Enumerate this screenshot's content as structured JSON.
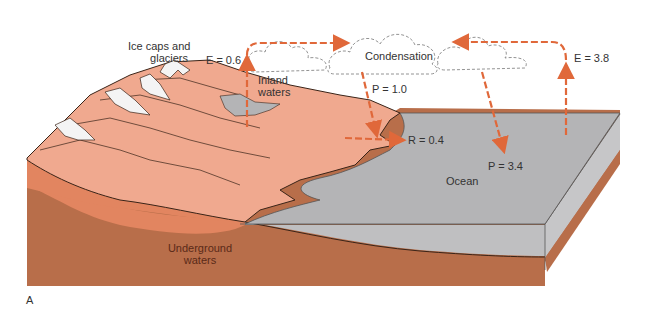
{
  "figure": {
    "panel_label": "A"
  },
  "labels": {
    "ice_caps": "Ice caps and\nglaciers",
    "ice_caps_line1": "Ice caps and",
    "ice_caps_line2": "glaciers",
    "inland_line1": "Inland",
    "inland_line2": "waters",
    "condensation": "Condensation",
    "ocean": "Ocean",
    "underground_line1": "Underground",
    "underground_line2": "waters"
  },
  "flows": [
    {
      "id": "evap_land",
      "label": "E = 0.6",
      "type": "evaporation",
      "from": "inland waters",
      "to": "atmosphere"
    },
    {
      "id": "precip_land",
      "label": "P = 1.0",
      "type": "precipitation",
      "from": "clouds",
      "to": "land"
    },
    {
      "id": "runoff",
      "label": "R = 0.4",
      "type": "runoff",
      "from": "land",
      "to": "ocean"
    },
    {
      "id": "precip_ocean",
      "label": "P = 3.4",
      "type": "precipitation",
      "from": "clouds",
      "to": "ocean"
    },
    {
      "id": "evap_ocean",
      "label": "E = 3.8",
      "type": "evaporation",
      "from": "ocean",
      "to": "atmosphere"
    }
  ],
  "colors": {
    "arrow": "#e0683a",
    "land_surface": "#f0a98f",
    "land_mid_layer": "#e28560",
    "bedrock": "#b86e4a",
    "ocean_top": "#b4b4b6",
    "ocean_side": "#bfbfc1",
    "snow": "#f4f4f4",
    "outline": "#3a2418"
  }
}
